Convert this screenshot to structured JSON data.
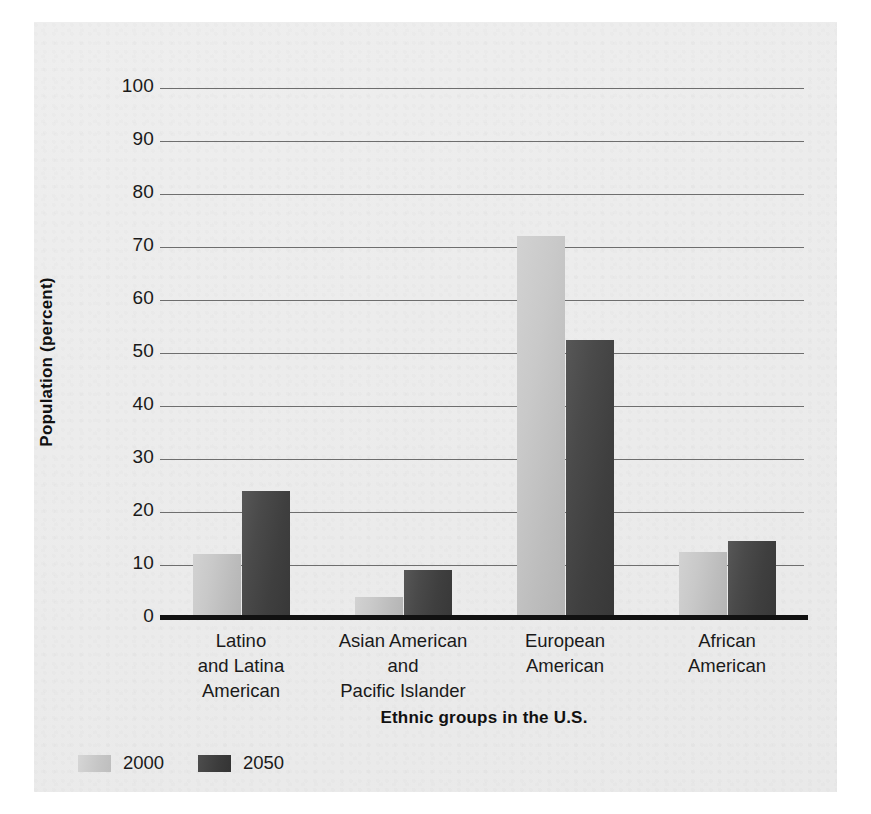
{
  "chart_data": {
    "type": "bar",
    "title": "",
    "xlabel": "Ethnic groups in the U.S.",
    "ylabel": "Population (percent)",
    "ylim": [
      0,
      100
    ],
    "ytick_step": 10,
    "yticks": [
      100,
      90,
      80,
      70,
      60,
      50,
      40,
      30,
      20,
      10,
      0
    ],
    "ytick_labels": [
      "100",
      "90",
      "80",
      "70",
      "60",
      "50",
      "40",
      "30",
      "20",
      "10",
      "0"
    ],
    "grid": true,
    "legend_position": "bottom-left",
    "categories": [
      "Latino\nand Latina\nAmerican",
      "Asian American\nand\nPacific Islander",
      "European\nAmerican",
      "African\nAmerican"
    ],
    "category_lines": [
      [
        "Latino",
        "and Latina",
        "American"
      ],
      [
        "Asian American",
        "and",
        "Pacific Islander"
      ],
      [
        "European",
        "American"
      ],
      [
        "African",
        "American"
      ]
    ],
    "series": [
      {
        "name": "2000",
        "color": "#c6c6c6",
        "values": [
          12,
          4,
          72,
          12.5
        ]
      },
      {
        "name": "2050",
        "color": "#3d3d3d",
        "values": [
          24,
          9,
          52.5,
          14.5
        ]
      }
    ]
  },
  "legend": {
    "items": [
      {
        "label": "2000",
        "swatch": "light"
      },
      {
        "label": "2050",
        "swatch": "dark"
      }
    ]
  }
}
